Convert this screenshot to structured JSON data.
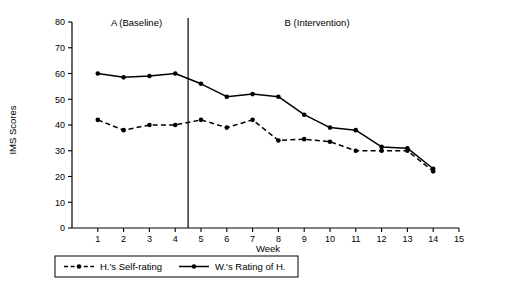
{
  "chart_data": {
    "type": "line",
    "title": "",
    "xlabel": "Week",
    "ylabel": "IMS Scores",
    "xlim": [
      0,
      15
    ],
    "ylim": [
      0,
      80
    ],
    "grid": false,
    "legend_position": "bottom",
    "x": [
      1,
      2,
      3,
      4,
      5,
      6,
      7,
      8,
      9,
      10,
      11,
      12,
      13,
      14
    ],
    "x_tick_labels": [
      "1",
      "2",
      "3",
      "4",
      "5",
      "6",
      "7",
      "8",
      "9",
      "10",
      "11",
      "12",
      "13",
      "14",
      "15"
    ],
    "x_ticks": [
      1,
      2,
      3,
      4,
      5,
      6,
      7,
      8,
      9,
      10,
      11,
      12,
      13,
      14,
      15
    ],
    "y_tick_labels": [
      "0",
      "10",
      "20",
      "30",
      "40",
      "50",
      "60",
      "70",
      "80"
    ],
    "y_ticks": [
      0,
      10,
      20,
      30,
      40,
      50,
      60,
      70,
      80
    ],
    "series": [
      {
        "name": "H.'s Self-rating",
        "style": "dashed",
        "marker": "circle",
        "color": "#000000",
        "values": [
          42,
          38,
          40,
          40,
          42,
          39,
          42,
          34,
          34.5,
          33.5,
          30,
          30,
          30,
          22
        ]
      },
      {
        "name": "W.'s Rating of H.",
        "style": "solid",
        "marker": "circle",
        "color": "#000000",
        "values": [
          60,
          58.5,
          59,
          60,
          56,
          51,
          52,
          51,
          44,
          39,
          38,
          31.5,
          31,
          23
        ]
      }
    ],
    "phases": [
      {
        "label": "A (Baseline)",
        "start": 1,
        "end": 4
      },
      {
        "label": "B (Intervention)",
        "start": 5,
        "end": 14
      }
    ],
    "phase_divider_x": 4.5,
    "annotations": []
  },
  "legend": {
    "entries": [
      {
        "label": "H.'s Self-rating",
        "style": "dashed"
      },
      {
        "label": "W.'s Rating of H.",
        "style": "solid"
      }
    ]
  }
}
